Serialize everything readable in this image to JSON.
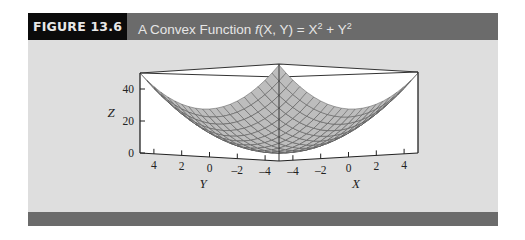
{
  "figure": {
    "label": "FIGURE 13.6",
    "title_prefix": "A Convex Function ",
    "title_func": "f",
    "title_args": "(X, Y)",
    "title_eq": " = X",
    "title_sup1": "2",
    "title_plus": " + Y",
    "title_sup2": "2"
  },
  "colors": {
    "header_bar": "#6b6b6b",
    "label_box": "#0b0b0b",
    "panel": "#dedede",
    "surface": "#bdbdbd",
    "mesh": "#5a5a5a"
  },
  "chart_data": {
    "type": "surface",
    "function": "Z = X^2 + Y^2",
    "xlabel": "X",
    "ylabel": "Y",
    "zlabel": "Z",
    "x_ticks": [
      "-4",
      "-2",
      "0",
      "2",
      "4"
    ],
    "y_ticks": [
      "4",
      "2",
      "0",
      "-2",
      "-4"
    ],
    "z_ticks": [
      "0",
      "20",
      "40"
    ],
    "xlim": [
      -5,
      5
    ],
    "ylim": [
      -5,
      5
    ],
    "zlim": [
      0,
      50
    ],
    "grid": false,
    "mesh_steps": 20
  }
}
